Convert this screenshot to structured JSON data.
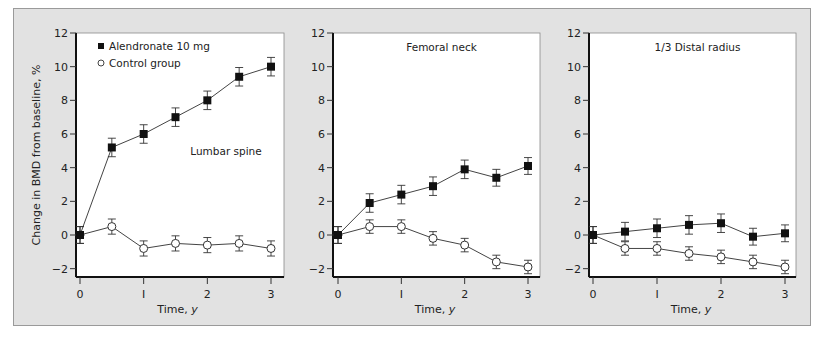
{
  "chart_data": [
    {
      "type": "line",
      "title": "Lumbar spine",
      "xlabel": "Time, y",
      "ylabel": "Change in BMD from baseline, %",
      "x": [
        0,
        0.5,
        1,
        1.5,
        2,
        2.5,
        3
      ],
      "xticks": [
        0,
        1,
        2,
        3
      ],
      "yticks": [
        -2,
        0,
        2,
        4,
        6,
        8,
        10,
        12
      ],
      "ylim": [
        -2.5,
        12
      ],
      "xlim": [
        -0.05,
        3.2
      ],
      "grid": false,
      "legend_position": "upper left",
      "series": [
        {
          "name": "Alendronate 10 mg",
          "marker": "filled-square",
          "values": [
            0,
            5.2,
            6.0,
            7.0,
            8.0,
            9.4,
            10.0
          ],
          "error": [
            0.5,
            0.55,
            0.55,
            0.55,
            0.55,
            0.55,
            0.55
          ]
        },
        {
          "name": "Control group",
          "marker": "open-circle",
          "values": [
            0,
            0.5,
            -0.8,
            -0.5,
            -0.6,
            -0.5,
            -0.8
          ],
          "error": [
            0.5,
            0.45,
            0.45,
            0.45,
            0.45,
            0.45,
            0.45
          ]
        }
      ]
    },
    {
      "type": "line",
      "title": "Femoral neck",
      "xlabel": "Time, y",
      "ylabel": "",
      "x": [
        0,
        0.5,
        1,
        1.5,
        2,
        2.5,
        3
      ],
      "xticks": [
        0,
        1,
        2,
        3
      ],
      "yticks": [
        -2,
        0,
        2,
        4,
        6,
        8,
        10,
        12
      ],
      "ylim": [
        -2.5,
        12
      ],
      "xlim": [
        -0.05,
        3.2
      ],
      "grid": false,
      "series": [
        {
          "name": "Alendronate 10 mg",
          "marker": "filled-square",
          "values": [
            0,
            1.9,
            2.4,
            2.9,
            3.9,
            3.4,
            4.1
          ],
          "error": [
            0.5,
            0.55,
            0.55,
            0.55,
            0.55,
            0.5,
            0.5
          ]
        },
        {
          "name": "Control group",
          "marker": "open-circle",
          "values": [
            0,
            0.5,
            0.5,
            -0.2,
            -0.6,
            -1.6,
            -1.9
          ],
          "error": [
            0.5,
            0.4,
            0.4,
            0.4,
            0.4,
            0.4,
            0.4
          ]
        }
      ]
    },
    {
      "type": "line",
      "title": "1/3 Distal radius",
      "xlabel": "Time, y",
      "ylabel": "",
      "x": [
        0,
        0.5,
        1,
        1.5,
        2,
        2.5,
        3
      ],
      "xticks": [
        0,
        1,
        2,
        3
      ],
      "yticks": [
        -2,
        0,
        2,
        4,
        6,
        8,
        10,
        12
      ],
      "ylim": [
        -2.5,
        12
      ],
      "xlim": [
        -0.05,
        3.2
      ],
      "grid": false,
      "series": [
        {
          "name": "Alendronate 10 mg",
          "marker": "filled-square",
          "values": [
            0,
            0.2,
            0.4,
            0.6,
            0.7,
            -0.1,
            0.1
          ],
          "error": [
            0.5,
            0.55,
            0.55,
            0.55,
            0.55,
            0.5,
            0.5
          ]
        },
        {
          "name": "Control group",
          "marker": "open-circle",
          "values": [
            0,
            -0.8,
            -0.8,
            -1.1,
            -1.3,
            -1.6,
            -1.9
          ],
          "error": [
            0.5,
            0.4,
            0.4,
            0.4,
            0.4,
            0.4,
            0.4
          ]
        }
      ]
    }
  ],
  "legend": {
    "items": [
      {
        "label": "Alendronate 10 mg",
        "marker": "filled-square"
      },
      {
        "label": "Control group",
        "marker": "open-circle"
      }
    ]
  },
  "labels": {
    "ylabel": "Change in BMD from baseline, %",
    "xlabel_prefix": "Time, ",
    "xlabel_unit": "y"
  },
  "colors": {
    "frame_bg": "#e2e2e2",
    "plot_bg": "#ffffff",
    "ink": "#111111",
    "line": "#444444"
  }
}
